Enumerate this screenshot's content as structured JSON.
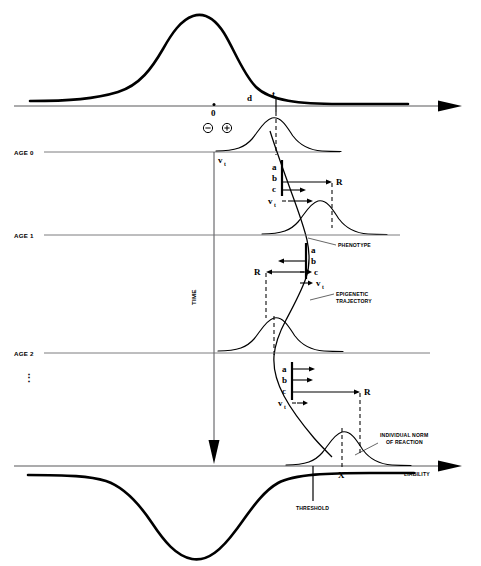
{
  "figure": {
    "type": "conceptual-diagram"
  },
  "axes": {
    "temperament": {
      "label": "TEMPERAMENT",
      "origin_label": "0",
      "deviation_label": "d",
      "target_label": "t"
    },
    "liability": {
      "label": "LIABILITY",
      "marker_label": "X",
      "threshold_label": "THRESHOLD"
    },
    "time": {
      "label": "TIME"
    }
  },
  "signs": {
    "negative": "⊖",
    "positive": "⊕"
  },
  "age_rows": [
    {
      "label": "AGE 0"
    },
    {
      "label": "AGE 1"
    },
    {
      "label": "AGE 2"
    }
  ],
  "continuation": "⋮",
  "annotations": {
    "phenotype": "PHENOTYPE",
    "epigenetic_trajectory_line1": "EPIGENETIC",
    "epigenetic_trajectory_line2": "TRAJECTORY",
    "norm_line1": "INDIVIDUAL NORM",
    "norm_line2": "OF REACTION"
  },
  "vector_labels": {
    "a": "a",
    "b": "b",
    "c": "c",
    "R": "R",
    "v": "v",
    "v_subscript": "t"
  },
  "clusters": [
    {
      "age": "AGE 0",
      "direction": "right",
      "labels": [
        "a",
        "b",
        "c",
        "v"
      ],
      "result": "R"
    },
    {
      "age": "AGE 1",
      "direction": "left",
      "labels": [
        "a",
        "b",
        "c",
        "v"
      ],
      "result": "R"
    },
    {
      "age": "AGE 2",
      "direction": "right",
      "labels": [
        "a",
        "b",
        "c",
        "v"
      ],
      "result": "R"
    }
  ],
  "colors": {
    "ink": "#000000",
    "axis": "#58585a",
    "rule": "#6d6d70",
    "background": "#ffffff"
  }
}
